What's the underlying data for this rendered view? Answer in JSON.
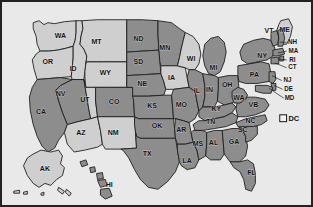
{
  "map": {
    "title": "United States choropleth map",
    "colors": {
      "shaded_fill": "#8d8d8d",
      "unshaded_fill": "#cfcfcf",
      "outline": "#1c1c1c",
      "background": "#e9e9e9",
      "frame": "#222222"
    },
    "legend": {
      "items": [
        {
          "label": "DC",
          "swatch": "unfilled-square",
          "swatch_color": "#f2f2f2"
        }
      ]
    },
    "states": [
      {
        "code": "WA",
        "name": "Washington",
        "shaded": false,
        "x": 58,
        "y": 30
      },
      {
        "code": "OR",
        "name": "Oregon",
        "shaded": false,
        "x": 45,
        "y": 56
      },
      {
        "code": "ID",
        "name": "Idaho",
        "shaded": false,
        "x": 71,
        "y": 63
      },
      {
        "code": "MT",
        "name": "Montana",
        "shaded": false,
        "x": 95,
        "y": 36
      },
      {
        "code": "WY",
        "name": "Wyoming",
        "shaded": false,
        "x": 104,
        "y": 68
      },
      {
        "code": "NV",
        "name": "Nevada",
        "shaded": true,
        "x": 58,
        "y": 89
      },
      {
        "code": "CA",
        "name": "California",
        "shaded": true,
        "x": 38,
        "y": 107
      },
      {
        "code": "UT",
        "name": "Utah",
        "shaded": false,
        "x": 83,
        "y": 95
      },
      {
        "code": "AZ",
        "name": "Arizona",
        "shaded": false,
        "x": 79,
        "y": 129
      },
      {
        "code": "CO",
        "name": "Colorado",
        "shaded": true,
        "x": 113,
        "y": 97
      },
      {
        "code": "NM",
        "name": "New Mexico",
        "shaded": false,
        "x": 112,
        "y": 129
      },
      {
        "code": "ND",
        "name": "North Dakota",
        "shaded": true,
        "x": 138,
        "y": 33
      },
      {
        "code": "SD",
        "name": "South Dakota",
        "shaded": true,
        "x": 138,
        "y": 56
      },
      {
        "code": "NE",
        "name": "Nebraska",
        "shaded": true,
        "x": 142,
        "y": 79
      },
      {
        "code": "KS",
        "name": "Kansas",
        "shaded": true,
        "x": 152,
        "y": 101
      },
      {
        "code": "OK",
        "name": "Oklahoma",
        "shaded": true,
        "x": 157,
        "y": 122
      },
      {
        "code": "TX",
        "name": "Texas",
        "shaded": true,
        "x": 147,
        "y": 150
      },
      {
        "code": "MN",
        "name": "Minnesota",
        "shaded": true,
        "x": 165,
        "y": 42
      },
      {
        "code": "IA",
        "name": "Iowa",
        "shaded": false,
        "x": 172,
        "y": 73
      },
      {
        "code": "MO",
        "name": "Missouri",
        "shaded": true,
        "x": 182,
        "y": 100
      },
      {
        "code": "AR",
        "name": "Arkansas",
        "shaded": true,
        "x": 182,
        "y": 126
      },
      {
        "code": "LA",
        "name": "Louisiana",
        "shaded": true,
        "x": 188,
        "y": 157
      },
      {
        "code": "WI",
        "name": "Wisconsin",
        "shaded": false,
        "x": 192,
        "y": 53
      },
      {
        "code": "IL",
        "name": "Illinois",
        "shaded": true,
        "x": 198,
        "y": 86
      },
      {
        "code": "MI",
        "name": "Michigan",
        "shaded": true,
        "x": 215,
        "y": 62
      },
      {
        "code": "IN",
        "name": "Indiana",
        "shaded": true,
        "x": 211,
        "y": 85
      },
      {
        "code": "OH",
        "name": "Ohio",
        "shaded": true,
        "x": 229,
        "y": 80
      },
      {
        "code": "KY",
        "name": "Kentucky",
        "shaded": true,
        "x": 218,
        "y": 104
      },
      {
        "code": "TN",
        "name": "Tennessee",
        "shaded": true,
        "x": 212,
        "y": 118
      },
      {
        "code": "MS",
        "name": "Mississippi",
        "shaded": true,
        "x": 199,
        "y": 140
      },
      {
        "code": "AL",
        "name": "Alabama",
        "shaded": true,
        "x": 215,
        "y": 139
      },
      {
        "code": "GA",
        "name": "Georgia",
        "shaded": true,
        "x": 236,
        "y": 138
      },
      {
        "code": "FL",
        "name": "Florida",
        "shaded": true,
        "x": 254,
        "y": 170
      },
      {
        "code": "SC",
        "name": "South Carolina",
        "shaded": true,
        "x": 245,
        "y": 126
      },
      {
        "code": "NC",
        "name": "North Carolina",
        "shaded": true,
        "x": 253,
        "y": 116
      },
      {
        "code": "VB",
        "name": "Virginia",
        "shaded": true,
        "x": 256,
        "y": 100
      },
      {
        "code": "WA",
        "name": "West Virginia",
        "shaded": true,
        "x": 241,
        "y": 93
      },
      {
        "code": "PA",
        "name": "Pennsylvania",
        "shaded": true,
        "x": 257,
        "y": 70
      },
      {
        "code": "NY",
        "name": "New York",
        "shaded": true,
        "x": 265,
        "y": 50
      },
      {
        "code": "VT",
        "name": "Vermont",
        "shaded": true,
        "x": 272,
        "y": 25
      },
      {
        "code": "ME",
        "name": "Maine",
        "shaded": false,
        "x": 288,
        "y": 24
      },
      {
        "code": "AK",
        "name": "Alaska",
        "shaded": false,
        "x": 42,
        "y": 165
      },
      {
        "code": "HI",
        "name": "Hawaii",
        "shaded": true,
        "x": 108,
        "y": 182
      }
    ],
    "callouts": [
      {
        "code": "NH",
        "name": "New Hampshire",
        "label_x": 296,
        "label_y": 36,
        "tip_x": 283,
        "tip_y": 36
      },
      {
        "code": "MA",
        "name": "Massachusetts",
        "label_x": 297,
        "label_y": 45,
        "tip_x": 281,
        "tip_y": 47
      },
      {
        "code": "RI",
        "name": "Rhode Island",
        "label_x": 296,
        "label_y": 54,
        "tip_x": 281,
        "tip_y": 53
      },
      {
        "code": "CT",
        "name": "Connecticut",
        "label_x": 296,
        "label_y": 62,
        "tip_x": 278,
        "tip_y": 57
      },
      {
        "code": "NJ",
        "name": "New Jersey",
        "label_x": 291,
        "label_y": 75,
        "tip_x": 275,
        "tip_y": 70
      },
      {
        "code": "DE",
        "name": "Delaware",
        "label_x": 292,
        "label_y": 84,
        "tip_x": 277,
        "tip_y": 80
      },
      {
        "code": "MD",
        "name": "Maryland",
        "label_x": 293,
        "label_y": 93,
        "tip_x": 272,
        "tip_y": 83
      }
    ]
  }
}
